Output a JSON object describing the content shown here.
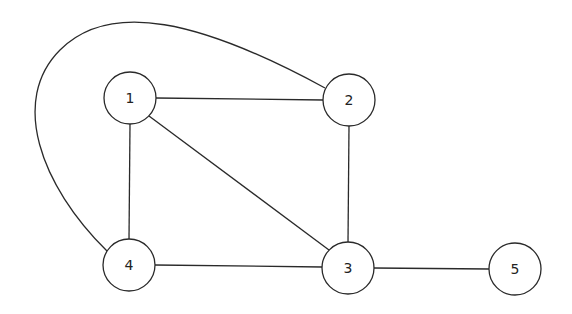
{
  "graph": {
    "nodes": [
      {
        "id": "1",
        "label": "1",
        "x": 130,
        "y": 98
      },
      {
        "id": "2",
        "label": "2",
        "x": 349,
        "y": 100
      },
      {
        "id": "3",
        "label": "3",
        "x": 348,
        "y": 268
      },
      {
        "id": "4",
        "label": "4",
        "x": 129,
        "y": 265
      },
      {
        "id": "5",
        "label": "5",
        "x": 515,
        "y": 269
      }
    ],
    "edges": [
      {
        "from": "1",
        "to": "2"
      },
      {
        "from": "1",
        "to": "4"
      },
      {
        "from": "1",
        "to": "3"
      },
      {
        "from": "2",
        "to": "3"
      },
      {
        "from": "4",
        "to": "3"
      },
      {
        "from": "3",
        "to": "5"
      },
      {
        "from": "4",
        "to": "2",
        "curved": true
      }
    ],
    "node_radius": 26,
    "stroke_color": "#2a2a2a",
    "background": "#ffffff"
  }
}
